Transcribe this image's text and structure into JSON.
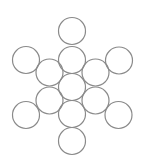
{
  "diagram": {
    "type": "circle-pattern",
    "stroke_color": "#8a8a8a",
    "background": "#ffffff",
    "stroke_width": 1.2,
    "radius": 13.5,
    "circles": [
      {
        "id": "top",
        "cx": 72,
        "cy": 31
      },
      {
        "id": "upper-middle",
        "cx": 72,
        "cy": 60
      },
      {
        "id": "center",
        "cx": 72,
        "cy": 87
      },
      {
        "id": "lower-middle",
        "cx": 72,
        "cy": 114
      },
      {
        "id": "bottom",
        "cx": 72,
        "cy": 141
      },
      {
        "id": "outer-top-left",
        "cx": 26,
        "cy": 60
      },
      {
        "id": "outer-top-right",
        "cx": 119,
        "cy": 60.5
      },
      {
        "id": "inner-upper-left",
        "cx": 49.5,
        "cy": 72.5
      },
      {
        "id": "inner-upper-right",
        "cx": 95.5,
        "cy": 72.5
      },
      {
        "id": "inner-lower-left",
        "cx": 49.5,
        "cy": 100.5
      },
      {
        "id": "inner-lower-right",
        "cx": 95.5,
        "cy": 100.5
      },
      {
        "id": "outer-bottom-left",
        "cx": 26,
        "cy": 115
      },
      {
        "id": "outer-bottom-right",
        "cx": 118.5,
        "cy": 115
      }
    ]
  }
}
